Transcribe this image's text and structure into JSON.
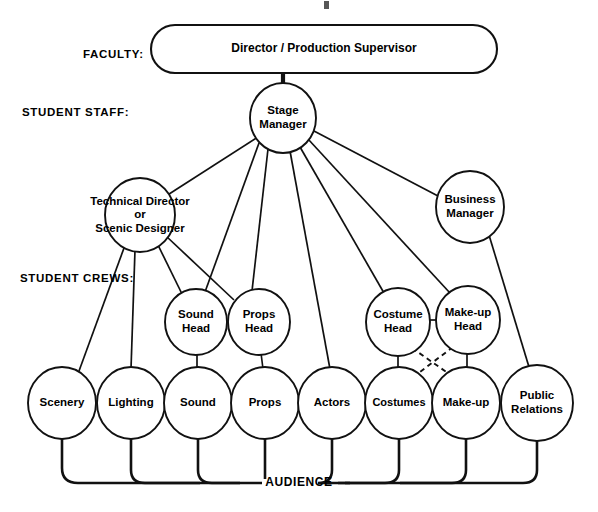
{
  "diagram": {
    "title_artifact": "",
    "rank_labels": [
      {
        "id": "faculty",
        "text": "FACULTY:",
        "x": 83,
        "y": 55
      },
      {
        "id": "student-staff",
        "text": "STUDENT STAFF:",
        "x": 22,
        "y": 113
      },
      {
        "id": "student-crews",
        "text": "STUDENT CREWS:",
        "x": 20,
        "y": 279
      }
    ],
    "audience": {
      "label": "AUDIENCE",
      "x": 299,
      "y": 483
    },
    "nodes": [
      {
        "id": "director",
        "label": "Director / Production Supervisor",
        "shape": "stadium",
        "x": 324,
        "y": 49,
        "w": 346,
        "h": 48,
        "lines": [
          "Director / Production Supervisor"
        ],
        "font": "wide"
      },
      {
        "id": "stage-manager",
        "label": "Stage Manager",
        "shape": "circle",
        "x": 283,
        "y": 118,
        "r": 33,
        "lines": [
          "Stage",
          "Manager"
        ],
        "font": "normal"
      },
      {
        "id": "technical-director",
        "label": "Technical Director or Scenic Designer",
        "shape": "circle",
        "x": 140,
        "y": 215,
        "r": 35,
        "lines": [
          "Technical Director",
          "or",
          "Scenic Designer"
        ],
        "font": "normal",
        "overflow": true
      },
      {
        "id": "business-manager",
        "label": "Business Manager",
        "shape": "circle",
        "x": 470,
        "y": 207,
        "r": 34,
        "lines": [
          "Business",
          "Manager"
        ],
        "font": "normal"
      },
      {
        "id": "sound-head",
        "label": "Sound Head",
        "shape": "circle",
        "x": 196,
        "y": 322,
        "r": 31,
        "lines": [
          "Sound",
          "Head"
        ],
        "font": "normal"
      },
      {
        "id": "props-head",
        "label": "Props Head",
        "shape": "circle",
        "x": 259,
        "y": 322,
        "r": 31,
        "lines": [
          "Props",
          "Head"
        ],
        "font": "normal"
      },
      {
        "id": "costume-head",
        "label": "Costume Head",
        "shape": "circle",
        "x": 398,
        "y": 322,
        "r": 32,
        "lines": [
          "Costume",
          "Head"
        ],
        "font": "normal"
      },
      {
        "id": "makeup-head",
        "label": "Make-up Head",
        "shape": "circle",
        "x": 468,
        "y": 320,
        "r": 32,
        "lines": [
          "Make-up",
          "Head"
        ],
        "font": "normal"
      },
      {
        "id": "scenery",
        "label": "Scenery",
        "shape": "circle",
        "x": 62,
        "y": 403,
        "r": 34,
        "lines": [
          "Scenery"
        ],
        "font": "normal"
      },
      {
        "id": "lighting",
        "label": "Lighting",
        "shape": "circle",
        "x": 131,
        "y": 403,
        "r": 34,
        "lines": [
          "Lighting"
        ],
        "font": "normal"
      },
      {
        "id": "sound",
        "label": "Sound",
        "shape": "circle",
        "x": 198,
        "y": 403,
        "r": 34,
        "lines": [
          "Sound"
        ],
        "font": "normal"
      },
      {
        "id": "props",
        "label": "Props",
        "shape": "circle",
        "x": 265,
        "y": 403,
        "r": 34,
        "lines": [
          "Props"
        ],
        "font": "normal"
      },
      {
        "id": "actors",
        "label": "Actors",
        "shape": "circle",
        "x": 332,
        "y": 403,
        "r": 34,
        "lines": [
          "Actors"
        ],
        "font": "normal"
      },
      {
        "id": "costumes",
        "label": "Costumes",
        "shape": "circle",
        "x": 399,
        "y": 403,
        "r": 34,
        "lines": [
          "Costumes"
        ],
        "font": "sm"
      },
      {
        "id": "makeup",
        "label": "Make-up",
        "shape": "circle",
        "x": 466,
        "y": 403,
        "r": 34,
        "lines": [
          "Make-up"
        ],
        "font": "normal"
      },
      {
        "id": "public-relations",
        "label": "Public Relations",
        "shape": "circle",
        "x": 537,
        "y": 403,
        "r": 36,
        "lines": [
          "Public",
          "Relations"
        ],
        "font": "normal"
      }
    ],
    "edges": [
      {
        "id": "director-to-stage-manager",
        "from": "director",
        "to": "stage-manager",
        "style": "thick",
        "d": "M 283,73 L 283,86"
      },
      {
        "id": "stage-manager-to-technical-director",
        "from": "stage-manager",
        "to": "technical-director",
        "style": "solid",
        "d": "M 258,137 L 166,196"
      },
      {
        "id": "stage-manager-to-business-manager",
        "from": "stage-manager",
        "to": "business-manager",
        "style": "solid",
        "d": "M 314,131 L 438,196"
      },
      {
        "id": "stage-manager-to-sound-head",
        "from": "stage-manager",
        "to": "sound-head",
        "style": "solid",
        "d": "M 259,143 L 205,292"
      },
      {
        "id": "stage-manager-to-props-head",
        "from": "stage-manager",
        "to": "props-head",
        "style": "solid",
        "d": "M 268,149 L 252,291"
      },
      {
        "id": "stage-manager-to-actors",
        "from": "stage-manager",
        "to": "actors",
        "style": "solid",
        "d": "M 290,151 L 330,369"
      },
      {
        "id": "stage-manager-to-costume-head",
        "from": "stage-manager",
        "to": "costume-head",
        "style": "solid",
        "d": "M 300,147 L 384,293"
      },
      {
        "id": "stage-manager-to-makeup-head",
        "from": "stage-manager",
        "to": "makeup-head",
        "style": "solid",
        "d": "M 308,139 L 450,293"
      },
      {
        "id": "technical-director-to-scenery",
        "from": "technical-director",
        "to": "scenery",
        "style": "solid",
        "d": "M 124,248 L 79,371"
      },
      {
        "id": "technical-director-to-lighting",
        "from": "technical-director",
        "to": "lighting",
        "style": "solid",
        "d": "M 135,250 L 131,369"
      },
      {
        "id": "technical-director-to-sound-head",
        "from": "technical-director",
        "to": "sound-head",
        "style": "solid",
        "d": "M 157,243 L 183,296"
      },
      {
        "id": "technical-director-to-props-head",
        "from": "technical-director",
        "to": "props-head",
        "style": "solid",
        "d": "M 166,236 L 234,300"
      },
      {
        "id": "business-manager-to-public-relations",
        "from": "business-manager",
        "to": "public-relations",
        "style": "solid",
        "d": "M 489,235 L 529,367"
      },
      {
        "id": "costume-head-to-makeup-head",
        "from": "costume-head",
        "to": "makeup-head",
        "style": "solid",
        "d": "M 430,320 L 436,320"
      },
      {
        "id": "sound-head-to-sound",
        "from": "sound-head",
        "to": "sound",
        "style": "solid",
        "d": "M 197,353 L 197,369"
      },
      {
        "id": "props-head-to-props",
        "from": "props-head",
        "to": "props",
        "style": "solid",
        "d": "M 261,353 L 263,369"
      },
      {
        "id": "costume-head-to-costumes",
        "from": "costume-head",
        "to": "costumes",
        "style": "solid",
        "d": "M 398,354 L 398,369"
      },
      {
        "id": "makeup-head-to-makeup",
        "from": "makeup-head",
        "to": "makeup",
        "style": "solid",
        "d": "M 467,352 L 467,369"
      },
      {
        "id": "costume-head-to-makeup-dashed",
        "from": "costume-head",
        "to": "makeup",
        "style": "dashed",
        "d": "M 412,348 L 455,378"
      },
      {
        "id": "makeup-head-to-costumes-dashed",
        "from": "makeup-head",
        "to": "costumes",
        "style": "dashed",
        "d": "M 453,347 L 412,378"
      }
    ],
    "audience_links": [
      {
        "id": "scenery-to-audience",
        "from": "scenery",
        "d": "M 62,437 L 62,468 Q 62,483 78,483 L 160,483"
      },
      {
        "id": "lighting-to-audience",
        "from": "lighting",
        "d": "M 131,437 L 131,470 Q 131,483 145,483 L 200,483"
      },
      {
        "id": "sound-to-audience",
        "from": "sound",
        "d": "M 198,437 L 198,470 Q 198,483 212,483 L 240,483"
      },
      {
        "id": "props-to-audience",
        "from": "props",
        "d": "M 265,437 L 265,479"
      },
      {
        "id": "actors-to-audience",
        "from": "actors",
        "d": "M 332,437 L 332,470 Q 332,483 318,483 L 350,483"
      },
      {
        "id": "costumes-to-audience",
        "from": "costumes",
        "d": "M 399,437 L 399,470 Q 399,483 385,483 L 345,483"
      },
      {
        "id": "makeup-to-audience",
        "from": "makeup",
        "d": "M 466,437 L 466,470 Q 466,483 452,483 L 400,483"
      },
      {
        "id": "public-relations-to-audience",
        "from": "public-relations",
        "d": "M 537,439 L 537,470 Q 537,483 523,483 L 470,483"
      }
    ],
    "audience_rails": [
      {
        "id": "audience-rail-left",
        "d": "M 160,483 L 262,483"
      },
      {
        "id": "audience-rail-right",
        "d": "M 338,483 L 470,483"
      }
    ],
    "colors": {
      "stroke": "#111111",
      "fill": "#ffffff",
      "text": "#000000",
      "background": "#ffffff"
    }
  }
}
